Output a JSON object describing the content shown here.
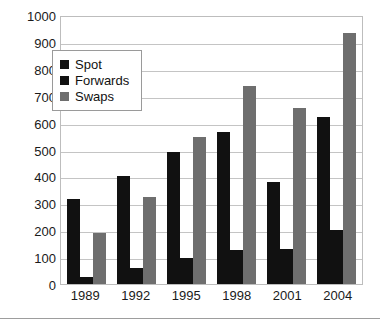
{
  "chart_data": {
    "type": "bar",
    "title": "",
    "xlabel": "",
    "ylabel": "",
    "categories": [
      "1989",
      "1992",
      "1995",
      "1998",
      "2001",
      "2004"
    ],
    "series": [
      {
        "name": "Spot",
        "color": "#111111",
        "values": [
          317,
          400,
          490,
          565,
          380,
          620
        ]
      },
      {
        "name": "Forwards",
        "color": "#111111",
        "values": [
          27,
          58,
          97,
          128,
          130,
          200
        ]
      },
      {
        "name": "Swaps",
        "color": "#6e6e6e",
        "values": [
          190,
          324,
          545,
          735,
          656,
          935
        ]
      }
    ],
    "ylim": [
      0,
      1000
    ],
    "y_ticks": [
      "0",
      "100",
      "200",
      "300",
      "400",
      "500",
      "600",
      "700",
      "800",
      "900",
      "1000"
    ],
    "grid": true,
    "legend_position": "upper-left-inside"
  }
}
